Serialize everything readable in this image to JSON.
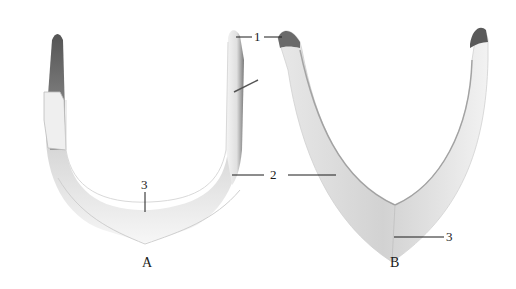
{
  "figure": {
    "panels": [
      {
        "id": "A",
        "label": "A",
        "shape": "U-shaped bone specimen"
      },
      {
        "id": "B",
        "label": "B",
        "shape": "V-shaped bone specimen"
      }
    ],
    "callouts": [
      {
        "number": "1",
        "targets": [
          "A right tip",
          "B left tip"
        ]
      },
      {
        "number": "2",
        "targets": [
          "A right arm",
          "B left arm"
        ]
      },
      {
        "number": "3",
        "targets": [
          "A bottom midline",
          "B bottom apex"
        ]
      }
    ],
    "colors": {
      "background": "#ffffff",
      "bone_light": "#f2f2f2",
      "bone_shadow": "#8a8a8a",
      "bone_dark": "#4a4a4a",
      "leader_line": "#1a1a1a"
    }
  },
  "labels": {
    "panel_a": "A",
    "panel_b": "B",
    "callout_1": "1",
    "callout_2": "2",
    "callout_3_a": "3",
    "callout_3_b": "3"
  }
}
